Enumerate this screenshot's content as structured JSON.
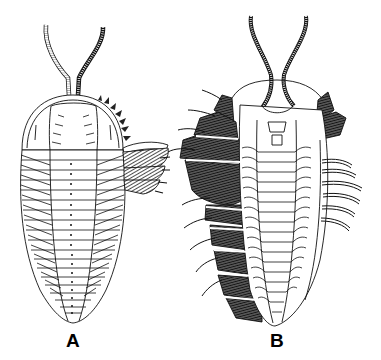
{
  "figure": {
    "panels": [
      {
        "id": "A",
        "label": "A",
        "view": "dorsal"
      },
      {
        "id": "B",
        "label": "B",
        "view": "ventral"
      }
    ],
    "colors": {
      "ink": "#111111",
      "background": "#ffffff",
      "shade": "#333333"
    }
  }
}
